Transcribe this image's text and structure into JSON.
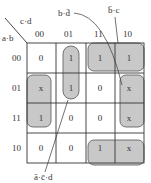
{
  "axes": {
    "row_var": "a·b",
    "col_var": "c·d"
  },
  "columns": [
    "00",
    "01",
    "11",
    "10"
  ],
  "rows": [
    "00",
    "01",
    "11",
    "10"
  ],
  "cells": [
    [
      "0",
      "1",
      "1",
      "1"
    ],
    [
      "x",
      "1",
      "0",
      "x"
    ],
    [
      "1",
      "0",
      "0",
      "x"
    ],
    [
      "0",
      "0",
      "1",
      "x"
    ]
  ],
  "annotations": {
    "top_left": "b·d̄",
    "top_right": "b̄·c",
    "bottom": "ā·c̄·d"
  },
  "colors": {
    "group_fill": "#c8c8c8",
    "line": "#333333"
  }
}
